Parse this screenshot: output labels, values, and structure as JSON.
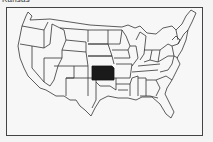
{
  "title": "Kansas",
  "map": {
    "region": "United States",
    "highlighted_state": "Kansas",
    "highlight_color": "#1a1a1a",
    "outline_color": "#333333",
    "fill_color": "#f7f7f7"
  }
}
